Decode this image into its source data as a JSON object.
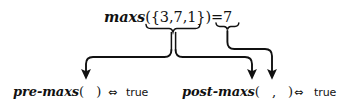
{
  "figure": {
    "background_color": "#ffffff",
    "ink_color": "#111111",
    "width": 361,
    "height": 108
  },
  "top_expression": {
    "function_name": "maxs",
    "open_paren": "(",
    "set_open": "{",
    "set_elements": [
      "3",
      "7",
      "1"
    ],
    "set_separator": ",",
    "set_close": "}",
    "close_paren": ")",
    "equals": "=",
    "result": "7",
    "full_text": "maxs({3,7,1}) = 7"
  },
  "braces": {
    "argument_brace_label": "underbrace-under-set",
    "result_brace_label": "underbrace-under-result"
  },
  "bottom_row": {
    "pre_condition": {
      "function_name": "pre-maxs",
      "open_paren": "(",
      "arguments": "",
      "close_paren": ")",
      "iff_symbol": "⇔",
      "value": "true"
    },
    "post_condition": {
      "function_name": "post-maxs",
      "open_paren": "(",
      "argument_separator": ",",
      "close_paren": ")",
      "iff_symbol": "⇔",
      "value": "true"
    }
  },
  "arrows": [
    {
      "name": "set-to-pre-argument",
      "from": "argument-underbrace",
      "to": "pre-maxs-argument-slot"
    },
    {
      "name": "set-to-post-first-argument",
      "from": "argument-underbrace",
      "to": "post-maxs-first-argument-slot"
    },
    {
      "name": "result-to-post-second-argument",
      "from": "result-underbrace",
      "to": "post-maxs-second-argument-slot"
    }
  ]
}
